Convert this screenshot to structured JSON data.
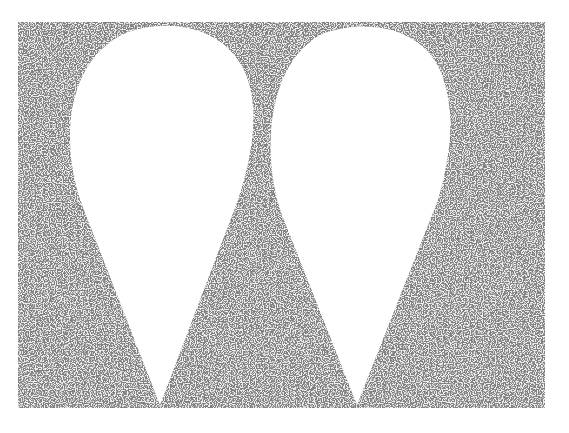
{
  "illustration": {
    "subject": "two white teardrop shapes on a stippled field",
    "shape_count": 2,
    "colors": {
      "paper": "#ffffff",
      "stipple_dark": "#3a3a3a",
      "stipple_light": "#e8e8e8"
    }
  }
}
